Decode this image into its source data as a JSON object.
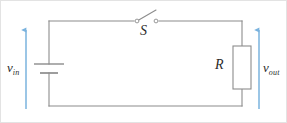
{
  "figure": {
    "width": 287,
    "height": 123,
    "background_color": "#ffffff",
    "border_color": "#e3e3e3"
  },
  "colors": {
    "wire": "#8c8c8c",
    "component_outline": "#8c8c8c",
    "arrow": "#7ab3de",
    "label_text": "#2b2b2b"
  },
  "labels": {
    "input_voltage": "v",
    "input_voltage_subscript": "in",
    "output_voltage": "v",
    "output_voltage_subscript": "out",
    "switch": "S",
    "resistor": "R"
  },
  "components": [
    {
      "name": "voltage-source",
      "type": "battery",
      "label": "v_in",
      "position": "left branch",
      "state": "long plate on top, short plate below"
    },
    {
      "name": "switch",
      "type": "spst-switch",
      "label": "S",
      "position": "top branch",
      "state": "open"
    },
    {
      "name": "resistor",
      "type": "resistor",
      "label": "R",
      "position": "right branch",
      "state": "rectangular IEC body"
    }
  ],
  "annotations": [
    {
      "name": "input-voltage-arrow",
      "label": "v_in",
      "direction": "up",
      "color": "#7ab3de"
    },
    {
      "name": "output-voltage-arrow",
      "label": "v_out",
      "direction": "up",
      "color": "#7ab3de"
    }
  ],
  "geometry": {
    "loop_left_x": 48,
    "loop_right_x": 241,
    "loop_top_y": 20,
    "loop_bottom_y": 105,
    "switch_terminal_left_x": 136,
    "switch_terminal_right_x": 155,
    "resistor_box": {
      "x": 232,
      "y": 45,
      "width": 18,
      "height": 43
    },
    "input_arrow_x": 25,
    "output_arrow_x": 258,
    "arrow_top_y": 28,
    "arrow_bottom_y": 108
  }
}
